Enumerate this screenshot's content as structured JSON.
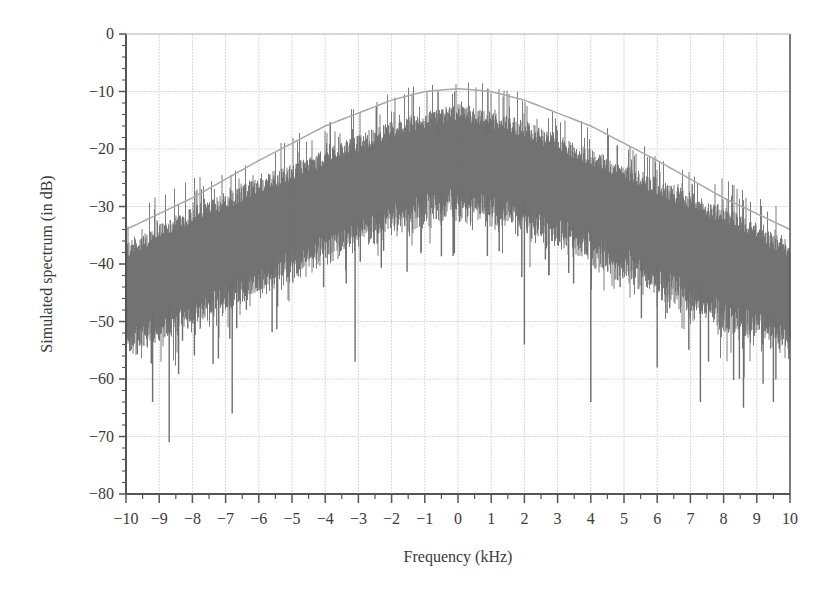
{
  "chart_data": {
    "type": "line",
    "title": "",
    "xlabel": "Frequency (kHz)",
    "ylabel": "Simulated spectrum (in dB)",
    "xlim": [
      -10,
      10
    ],
    "ylim": [
      -80,
      0
    ],
    "grid": true,
    "legend": null,
    "x_ticks": [
      -10,
      -9,
      -8,
      -7,
      -6,
      -5,
      -4,
      -3,
      -2,
      -1,
      0,
      1,
      2,
      3,
      4,
      5,
      6,
      7,
      8,
      9,
      10
    ],
    "x_tick_labels": [
      "−10",
      "−9",
      "−8",
      "−7",
      "−6",
      "−5",
      "−4",
      "−3",
      "−2",
      "−1",
      "0",
      "1",
      "2",
      "3",
      "4",
      "5",
      "6",
      "7",
      "8",
      "9",
      "10"
    ],
    "y_ticks": [
      0,
      -10,
      -20,
      -30,
      -40,
      -50,
      -60,
      -70,
      -80
    ],
    "y_tick_labels": [
      "0",
      "−10",
      "−20",
      "−30",
      "−40",
      "−50",
      "−60",
      "−70",
      "−80"
    ],
    "series": [
      {
        "name": "Envelope (theoretical spectrum)",
        "style": "thin light-gray smooth curve",
        "x": [
          -10,
          -8,
          -6,
          -4,
          -2,
          -1,
          0,
          1,
          2,
          4,
          6,
          8,
          10
        ],
        "y": [
          -34,
          -28.5,
          -22,
          -16,
          -11.5,
          -10,
          -9.5,
          -10,
          -11.5,
          -16,
          -22,
          -28.5,
          -34
        ]
      },
      {
        "name": "Simulated spectrum (noisy)",
        "style": "dense dark-gray vertical-line noise band",
        "band_top_x": [
          -10,
          -8,
          -6,
          -4,
          -2,
          0,
          2,
          4,
          6,
          8,
          10
        ],
        "band_top_y": [
          -36,
          -30,
          -25,
          -20,
          -15,
          -12,
          -15,
          -20,
          -25,
          -30,
          -36
        ],
        "band_bottom_x": [
          -10,
          -8,
          -6,
          -4,
          -2,
          0,
          2,
          4,
          6,
          8,
          10
        ],
        "band_bottom_y": [
          -54,
          -50,
          -44,
          -38,
          -33,
          -30,
          -33,
          -38,
          -44,
          -50,
          -54
        ],
        "notable_dips": [
          {
            "x": -9.2,
            "y": -64
          },
          {
            "x": -8.7,
            "y": -71
          },
          {
            "x": -6.8,
            "y": -66
          },
          {
            "x": -3.1,
            "y": -57
          },
          {
            "x": 2.0,
            "y": -54
          },
          {
            "x": 4.0,
            "y": -64
          },
          {
            "x": 6.0,
            "y": -58
          },
          {
            "x": 7.3,
            "y": -64
          },
          {
            "x": 8.6,
            "y": -65
          },
          {
            "x": 9.5,
            "y": -64
          }
        ],
        "notable_peaks": [
          {
            "x": 0.9,
            "y": -9.5
          },
          {
            "x": -0.6,
            "y": -10
          }
        ]
      }
    ]
  },
  "colors": {
    "noise": "#6e6e6e",
    "envelope": "#a8a8a8",
    "grid": "#d9d9d9",
    "axis": "#555555",
    "text": "#3a3a3a"
  },
  "layout": {
    "plot_left": 126,
    "plot_right": 790,
    "plot_top": 34,
    "plot_bottom": 494
  }
}
